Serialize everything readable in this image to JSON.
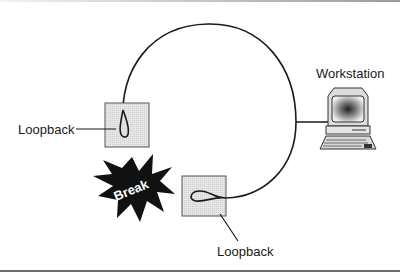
{
  "diagram": {
    "type": "ring network with loopback plugs",
    "labels": {
      "workstation": "Workstation",
      "loopback_left": "Loopback",
      "loopback_bottom": "Loopback",
      "break": "Break"
    },
    "nodes": [
      {
        "id": "workstation",
        "label": "Workstation",
        "icon": "computer-icon"
      },
      {
        "id": "loopback-left",
        "label": "Loopback",
        "icon": "loopback-plug-icon"
      },
      {
        "id": "loopback-bottom",
        "label": "Loopback",
        "icon": "loopback-plug-icon"
      },
      {
        "id": "break",
        "label": "Break",
        "icon": "starburst-icon"
      }
    ],
    "edges": [
      {
        "from": "loopback-left",
        "to": "workstation",
        "style": "curved cable (arc over top)"
      },
      {
        "from": "workstation",
        "to": "loopback-bottom",
        "style": "curved cable (arc down right side)"
      }
    ],
    "colors": {
      "line": "#1a1a1a",
      "box_fill": "#e2e2e2",
      "box_stroke": "#555555",
      "burst_fill": "#111111",
      "burst_text": "#ffffff"
    }
  }
}
